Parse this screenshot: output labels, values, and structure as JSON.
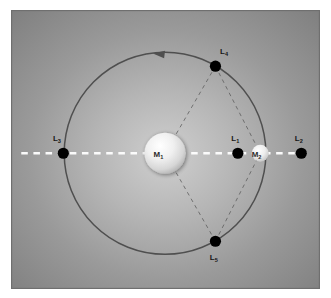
{
  "figure": {
    "background_color": "#8a8a8a",
    "panel_border_color": "#6f6f6f",
    "orbit_color": "#4a4a4a",
    "axis_color": "#ffffff",
    "dash_line_color": "#565656",
    "point_color": "#000000"
  },
  "bodies": [
    {
      "id": "primary",
      "label": "M",
      "subscript": "1",
      "x": 165,
      "y": 153,
      "radius": 22,
      "fill": "#f2f2f2"
    },
    {
      "id": "secondary",
      "label": "M",
      "subscript": "2",
      "x": 267,
      "y": 153,
      "radius": 9,
      "fill": "#ededed"
    }
  ],
  "lagrange_points": [
    {
      "id": "L1",
      "label": "L",
      "subscript": "1",
      "x": 243,
      "y": 153,
      "label_x": 236,
      "label_y": 140,
      "radius": 6
    },
    {
      "id": "L2",
      "label": "L",
      "subscript": "2",
      "x": 311,
      "y": 153,
      "label_x": 304,
      "label_y": 140,
      "radius": 6
    },
    {
      "id": "L3",
      "label": "L",
      "subscript": "3",
      "x": 56,
      "y": 153,
      "label_x": 45,
      "label_y": 140,
      "radius": 6
    },
    {
      "id": "L4",
      "label": "L",
      "subscript": "4",
      "x": 219,
      "y": 60,
      "label_x": 224,
      "label_y": 47,
      "radius": 6
    },
    {
      "id": "L5",
      "label": "L",
      "subscript": "5",
      "x": 219,
      "y": 247,
      "label_x": 213,
      "label_y": 267,
      "radius": 6
    }
  ],
  "orbit": {
    "center_x": 165,
    "center_y": 153,
    "radius": 108,
    "direction": "counterclockwise",
    "arrow_label": "orbit-direction-arrow"
  },
  "axis": {
    "label": "line-of-centers-axis",
    "y": 153,
    "x_start": 11,
    "x_end": 320,
    "style": "dashed"
  },
  "triangles": [
    {
      "id": "upper-triangle",
      "vertices": "M1-L4-M2"
    },
    {
      "id": "lower-triangle",
      "vertices": "M1-L5-M2"
    }
  ]
}
